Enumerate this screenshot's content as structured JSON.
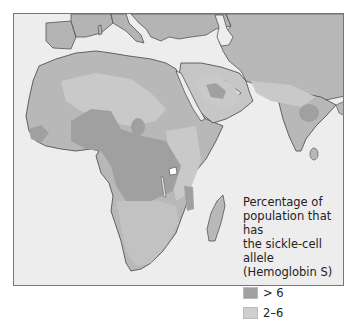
{
  "map": {
    "subject": "Distribution of the sickle-cell allele in Africa, Middle East and South Asia",
    "colors": {
      "water": "#ededed",
      "land_base": "#b8b8b8",
      "low_2_6": "#c9c9c9",
      "high_gt6": "#a0a0a0",
      "coast": "#444444"
    }
  },
  "legend": {
    "title_line1": "Percentage of",
    "title_line2": "population that has",
    "title_line3": "the sickle-cell allele",
    "title_line4": "(Hemoglobin S)",
    "items": [
      {
        "label": "> 6",
        "color": "#a0a0a0"
      },
      {
        "label": "2–6",
        "color": "#cfcfcf"
      }
    ]
  }
}
